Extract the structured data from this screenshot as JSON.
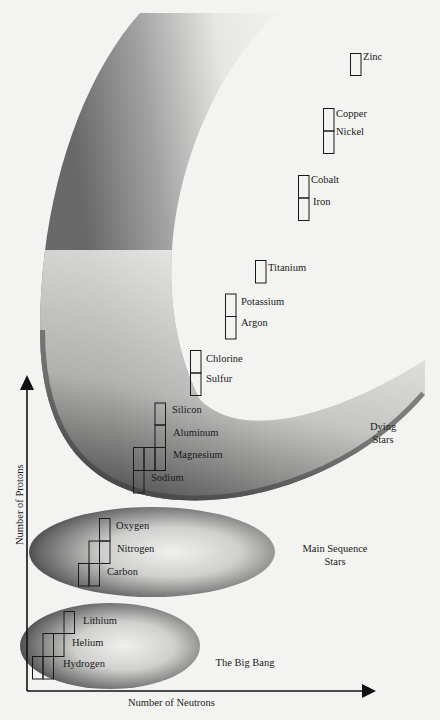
{
  "diagram": {
    "axes": {
      "x_label": "Number of Neutrons",
      "y_label": "Number of Protons"
    },
    "regions": [
      {
        "name": "The Big Bang",
        "label": "The Big Bang",
        "elements": [
          "Hydrogen",
          "Helium",
          "Lithium"
        ]
      },
      {
        "name": "Main Sequence Stars",
        "label_line1": "Main Sequence",
        "label_line2": "Stars",
        "elements": [
          "Carbon",
          "Nitrogen",
          "Oxygen"
        ]
      },
      {
        "name": "Dying Stars",
        "label_line1": "Dying",
        "label_line2": "Stars",
        "elements": [
          "Sodium",
          "Magnesium",
          "Aluminum",
          "Silicon",
          "Sulfur",
          "Chlorine",
          "Argon",
          "Potassium",
          "Titanium",
          "Iron",
          "Cobalt",
          "Nickel",
          "Copper",
          "Zinc"
        ]
      }
    ],
    "elements": {
      "hydrogen": "Hydrogen",
      "helium": "Helium",
      "lithium": "Lithium",
      "carbon": "Carbon",
      "nitrogen": "Nitrogen",
      "oxygen": "Oxygen",
      "sodium": "Sodium",
      "magnesium": "Magnesium",
      "aluminum": "Aluminum",
      "silicon": "Silicon",
      "sulfur": "Sulfur",
      "chlorine": "Chlorine",
      "argon": "Argon",
      "potassium": "Potassium",
      "titanium": "Titanium",
      "iron": "Iron",
      "cobalt": "Cobalt",
      "nickel": "Nickel",
      "copper": "Copper",
      "zinc": "Zinc"
    },
    "colors": {
      "background": "#f3f3f1",
      "ink": "#1a1a1a",
      "shade_dark": "#4a4a4a",
      "shade_light": "#f3f3f1"
    }
  }
}
